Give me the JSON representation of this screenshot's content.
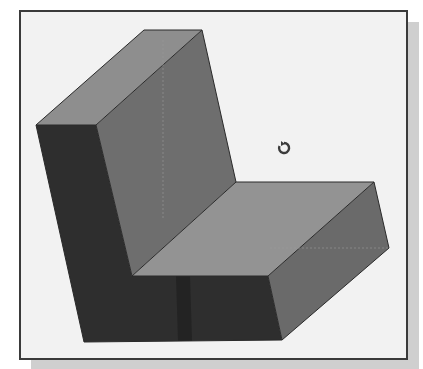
{
  "viewport": {
    "description": "3D shaded L-bracket solid model in CAD graphics window",
    "colors": {
      "background": "#f2f2f2",
      "frame": "#3a3a3a",
      "shadow": "#cfcfcf",
      "top_face": "#8e8e8e",
      "back_front_face": "#6e6e6e",
      "left_face": "#2e2e2e",
      "seat_top_face": "#929292",
      "seat_right_face": "#6a6a6a"
    },
    "cursor": {
      "icon": "rotate-cursor-icon"
    }
  }
}
